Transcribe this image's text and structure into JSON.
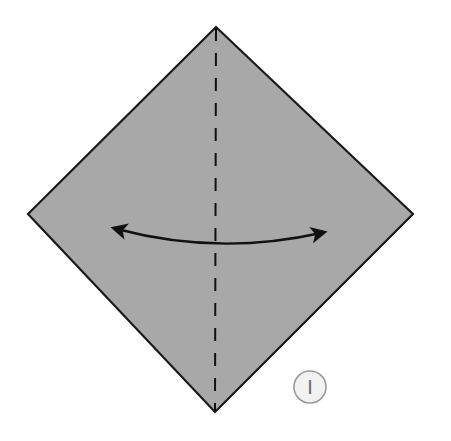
{
  "diagram": {
    "type": "origami-fold-step",
    "step_number": "1",
    "step_label_glyph": "I",
    "paper": {
      "shape": "square rotated 45° (diamond)",
      "fill": "#a8a8a8",
      "edge_color": "#1a1a1a",
      "vertices": {
        "top": [
          216,
          27
        ],
        "right": [
          413,
          214
        ],
        "bottom": [
          215,
          412
        ],
        "left": [
          28,
          214
        ]
      }
    },
    "fold_line": {
      "style": "valley-fold (dashed)",
      "orientation": "vertical",
      "from": [
        216,
        27
      ],
      "to": [
        215,
        412
      ],
      "color": "#111111"
    },
    "arrow": {
      "type": "fold-and-unfold (double-headed curved arrow)",
      "from": [
        110,
        225
      ],
      "to": [
        328,
        232
      ],
      "color": "#111111"
    },
    "step_circle": {
      "center": [
        310,
        387
      ],
      "radius": 16,
      "fill": "#f2f2f2",
      "stroke": "#9a9a9a"
    }
  }
}
